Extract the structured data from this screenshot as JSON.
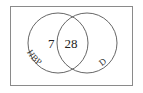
{
  "diagram": {
    "type": "venn",
    "sets": [
      {
        "id": "left",
        "label": "HBP"
      },
      {
        "id": "right",
        "label": "D"
      }
    ],
    "regions": {
      "left_only": "7",
      "intersection": "28",
      "right_only": ""
    },
    "colors": {
      "stroke": "#555555",
      "frame": "#8a8a8a",
      "text": "#222222",
      "background": "#ffffff"
    }
  }
}
